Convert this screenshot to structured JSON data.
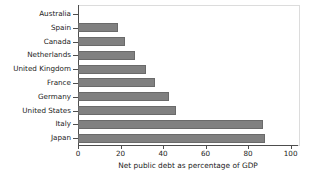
{
  "chart_data": {
    "type": "bar",
    "orientation": "horizontal",
    "title": "",
    "xlabel": "Net public debt as percentage of GDP",
    "ylabel": "",
    "categories": [
      "Australia",
      "Spain",
      "Canada",
      "Netherlands",
      "United Kingdom",
      "France",
      "Germany",
      "United States",
      "Italy",
      "Japan"
    ],
    "values": [
      0,
      19,
      22,
      27,
      32,
      36,
      43,
      46,
      87,
      88
    ],
    "xlim": [
      0,
      103
    ],
    "xticks": [
      0,
      20,
      40,
      60,
      80,
      100
    ],
    "xtick_labels": [
      "0",
      "20",
      "40",
      "60",
      "80",
      "100"
    ],
    "grid": false,
    "legend": null,
    "bar_color": "#808080",
    "bar_edge_color": "#6a6a6a",
    "axis_color": "#4d4d4d",
    "frame_color": "#dcdcdc",
    "background": "#ffffff"
  },
  "figure": {
    "cut_off_title_fragment": ""
  }
}
